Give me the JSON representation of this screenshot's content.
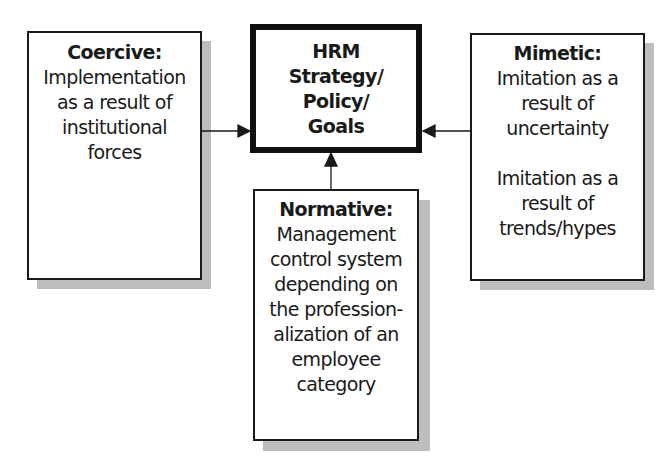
{
  "diagram": {
    "center": {
      "lines": [
        "HRM",
        "Strategy/",
        "Policy/",
        "Goals"
      ]
    },
    "coercive": {
      "title": "Coercive:",
      "lines": [
        "Implementation",
        "as a result of",
        "institutional",
        "forces"
      ]
    },
    "mimetic": {
      "title": "Mimetic:",
      "lines_1": [
        "Imitation as a",
        "result of",
        "uncertainty"
      ],
      "lines_2": [
        "Imitation as a",
        "result of",
        "trends/hypes"
      ]
    },
    "normative": {
      "title": "Normative:",
      "lines": [
        "Management",
        "control system",
        "depending on",
        "the profession-",
        "alization of an",
        "employee",
        "category"
      ]
    },
    "arrows": [
      {
        "from": "coercive",
        "to": "center"
      },
      {
        "from": "mimetic",
        "to": "center"
      },
      {
        "from": "normative",
        "to": "center"
      }
    ],
    "colors": {
      "border": "#1a1a1a",
      "shadow": "#bdbdbd",
      "background": "#ffffff"
    }
  }
}
